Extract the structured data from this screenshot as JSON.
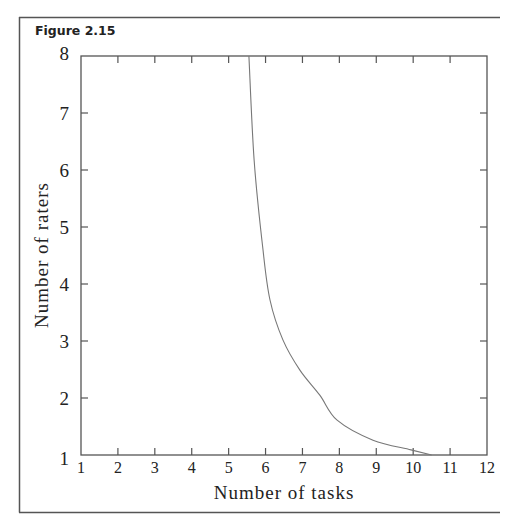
{
  "figure": {
    "title": "Figure 2.15"
  },
  "chart_data": {
    "type": "line",
    "title": "Figure 2.15",
    "xlabel": "Number of tasks",
    "ylabel": "Number of raters",
    "xlim": [
      1,
      12
    ],
    "ylim": [
      1,
      8
    ],
    "xticks": [
      1,
      2,
      3,
      4,
      5,
      6,
      7,
      8,
      9,
      10,
      11,
      12
    ],
    "yticks": [
      1,
      2,
      3,
      4,
      5,
      6,
      7,
      8
    ],
    "grid": false,
    "legend": null,
    "series": [
      {
        "name": "raters vs tasks",
        "x": [
          5.55,
          5.69,
          5.93,
          6.12,
          6.47,
          6.93,
          7.47,
          7.94,
          8.91,
          9.94,
          10.5
        ],
        "y": [
          8.0,
          6.18,
          4.6,
          3.72,
          3.02,
          2.49,
          2.05,
          1.61,
          1.26,
          1.09,
          1.0
        ]
      }
    ]
  },
  "colors": {
    "axis": "#555555",
    "curve": "#777777",
    "text": "#222222"
  }
}
